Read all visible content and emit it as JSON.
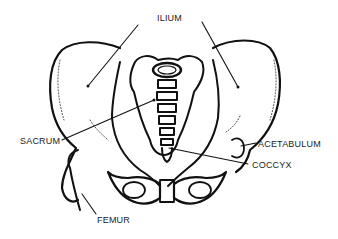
{
  "diagram": {
    "labels": {
      "ilium": "ILIUM",
      "sacrum": "SACRUM",
      "acetabulum": "ACETABULUM",
      "coccyx": "COCCYX",
      "femur": "FEMUR"
    }
  },
  "colors": {
    "line": "#111111",
    "background": "#ffffff",
    "text": "#222222"
  }
}
